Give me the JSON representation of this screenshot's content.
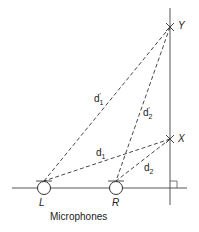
{
  "diagram": {
    "points": {
      "Y": "Y",
      "X": "X",
      "L": "L",
      "R": "R"
    },
    "distances": {
      "d1_prime": {
        "base": "d",
        "sub": "1",
        "sup": "'"
      },
      "d2_prime": {
        "base": "d",
        "sub": "2",
        "sup": "'"
      },
      "d1": {
        "base": "d",
        "sub": "1"
      },
      "d2": {
        "base": "d",
        "sub": "2"
      }
    },
    "caption": "Microphones"
  }
}
